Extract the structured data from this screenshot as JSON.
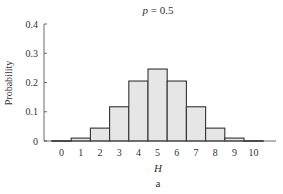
{
  "chart_data": {
    "type": "bar",
    "title": "p = 0.5",
    "title_var": "p",
    "title_rest": " = 0.5",
    "xlabel": "H",
    "ylabel": "Probability",
    "caption": "a",
    "categories": [
      "0",
      "1",
      "2",
      "3",
      "4",
      "5",
      "6",
      "7",
      "8",
      "9",
      "10"
    ],
    "values": [
      0.001,
      0.01,
      0.044,
      0.117,
      0.205,
      0.246,
      0.205,
      0.117,
      0.044,
      0.01,
      0.001
    ],
    "ylim": [
      0,
      0.4
    ],
    "yticks": [
      "0",
      "0.1",
      "0.2",
      "0.3",
      "0.4"
    ],
    "ytick_values": [
      0,
      0.1,
      0.2,
      0.3,
      0.4
    ],
    "grid": false,
    "legend": null,
    "bar_fill": "#e6e6e6",
    "bar_stroke": "#333333"
  }
}
